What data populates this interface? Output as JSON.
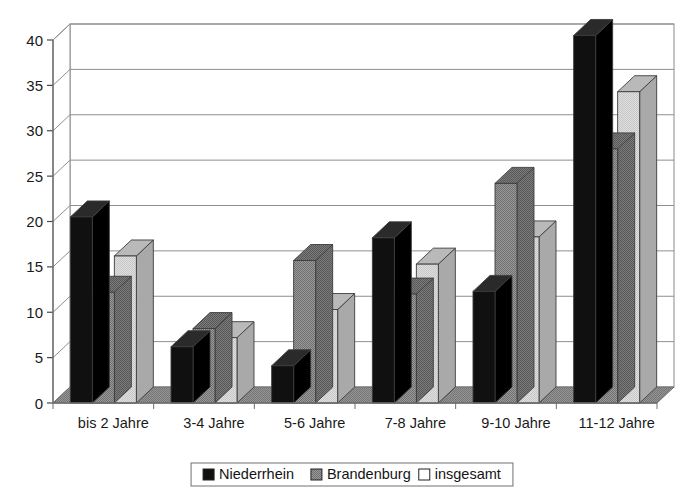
{
  "chart_data": {
    "type": "bar",
    "title": "",
    "subtitle": "",
    "xlabel": "",
    "ylabel": "",
    "categories": [
      "bis 2 Jahre",
      "3-4 Jahre",
      "5-6 Jahre",
      "7-8 Jahre",
      "9-10 Jahre",
      "11-12 Jahre"
    ],
    "series": [
      {
        "name": "Niederrhein",
        "color": "#101010",
        "pattern": "solid-black",
        "values": [
          20.5,
          6.2,
          4.1,
          18.2,
          12.3,
          40.5
        ]
      },
      {
        "name": "Brandenburg",
        "color": "#8a8a8a",
        "pattern": "dither-gray",
        "values": [
          12.2,
          8.2,
          15.7,
          12.0,
          24.2,
          28.0
        ]
      },
      {
        "name": "insgesamt",
        "color": "#d4d4d4",
        "pattern": "light-gray",
        "values": [
          16.2,
          7.2,
          10.3,
          15.3,
          18.3,
          34.3
        ]
      }
    ],
    "ylim": [
      0,
      40
    ],
    "yticks": [
      0,
      5,
      10,
      15,
      20,
      25,
      30,
      35,
      40
    ],
    "ytick_labels": [
      "0",
      "5",
      "10",
      "15",
      "20",
      "25",
      "30",
      "35",
      "40"
    ],
    "grid": true,
    "grid_axis": "y",
    "legend_position": "bottom",
    "style": "3d-column",
    "plot_background": "#ffffff",
    "floor_color": "#8c8c8c",
    "axis_color": "#6e6e6e",
    "gridline_color": "#8f8f8f"
  },
  "legend": {
    "entries": [
      {
        "label": "Niederrhein",
        "swatch": "#101010"
      },
      {
        "label": "Brandenburg",
        "swatch": "#8a8a8a"
      },
      {
        "label": "insgesamt",
        "swatch": "#ffffff"
      }
    ]
  }
}
